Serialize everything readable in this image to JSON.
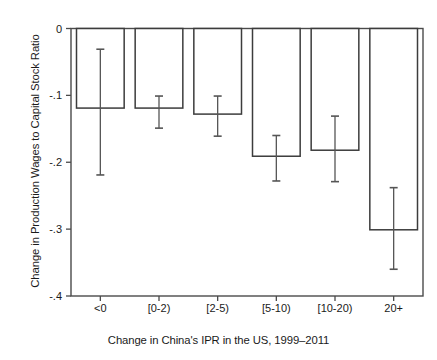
{
  "chart_data": {
    "type": "bar",
    "title": "",
    "xlabel": "Change in China's IPR in the US, 1999–2011",
    "ylabel": "Change in Production Wages to Capital Stock Ratio",
    "categories": [
      "<0",
      "[0-2)",
      "[2-5)",
      "[5-10)",
      "[10-20)",
      "20+"
    ],
    "values": [
      -0.119,
      -0.119,
      -0.128,
      -0.191,
      -0.182,
      -0.301
    ],
    "ci_lower": [
      -0.219,
      -0.149,
      -0.161,
      -0.228,
      -0.229,
      -0.36
    ],
    "ci_upper": [
      -0.031,
      -0.101,
      -0.101,
      -0.16,
      -0.131,
      -0.238
    ],
    "series": [
      {
        "name": "Change in Production Wages to Capital Stock Ratio",
        "values": [
          -0.119,
          -0.119,
          -0.128,
          -0.191,
          -0.182,
          -0.301
        ]
      }
    ],
    "ylim": [
      -0.4,
      0.0
    ],
    "ytick_values": [
      0,
      -0.1,
      -0.2,
      -0.3,
      -0.4
    ],
    "ytick_labels": [
      "0",
      "-.1",
      "-.2",
      "-.3",
      "-.4"
    ],
    "xtick_labels": [
      "<0",
      "[0-2)",
      "[2-5)",
      "[5-10)",
      "[10-20)",
      "20+"
    ],
    "grid": false,
    "legend": false,
    "legend_position": "none",
    "error_bars": "vertical-capped",
    "bar_fill_color": "#ffffff",
    "bar_edge_color": "#3c3c3c",
    "axis_color": "#4a4a4a",
    "error_bar_color": "#555555",
    "background_color": "#ffffff"
  }
}
